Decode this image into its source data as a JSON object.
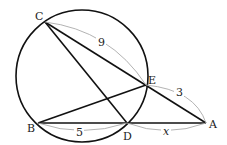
{
  "diagram": {
    "points": {
      "A": {
        "label": "A",
        "x": 206,
        "y": 123
      },
      "B": {
        "label": "B",
        "x": 38,
        "y": 123
      },
      "C": {
        "label": "C",
        "x": 45,
        "y": 22
      },
      "D": {
        "label": "D",
        "x": 127,
        "y": 123
      },
      "E": {
        "label": "E",
        "x": 146,
        "y": 85
      }
    },
    "circle": {
      "cx": 82,
      "cy": 76,
      "r": 66
    },
    "segments": [
      [
        "C",
        "A"
      ],
      [
        "C",
        "D"
      ],
      [
        "B",
        "E"
      ],
      [
        "B",
        "A"
      ]
    ],
    "measures": {
      "CE": "9",
      "EA": "3",
      "BD": "5",
      "DA": "x"
    },
    "colors": {
      "line": "#111111",
      "measure_arc": "#aaaaaa"
    }
  }
}
